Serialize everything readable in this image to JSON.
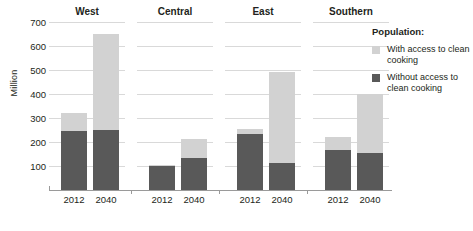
{
  "chart_data": {
    "type": "bar",
    "subtype": "stacked-bar-small-multiples",
    "title": "",
    "xlabel": "",
    "ylabel": "Million",
    "ylim": [
      0,
      700
    ],
    "yticks": [
      100,
      200,
      300,
      400,
      500,
      600,
      700
    ],
    "grid": true,
    "legend_position": "right",
    "legend_title": "Population:",
    "categories": [
      "2012",
      "2040"
    ],
    "panels": [
      "West",
      "Central",
      "East",
      "Southern"
    ],
    "series": [
      {
        "name": "Without access to clean cooking",
        "color": "#595959",
        "values_by_panel": {
          "West": [
            245,
            250
          ],
          "Central": [
            100,
            133
          ],
          "East": [
            232,
            112
          ],
          "Southern": [
            165,
            155
          ]
        }
      },
      {
        "name": "With access to clean cooking",
        "color": "#d2d2d2",
        "values_by_panel": {
          "West": [
            75,
            400
          ],
          "Central": [
            5,
            79
          ],
          "East": [
            21,
            378
          ],
          "Southern": [
            55,
            245
          ]
        }
      }
    ],
    "totals_by_panel": {
      "West": [
        320,
        650
      ],
      "Central": [
        105,
        212
      ],
      "East": [
        253,
        490
      ],
      "Southern": [
        220,
        400
      ]
    }
  },
  "axis": {
    "ylabel": "Million",
    "yticks": [
      "700",
      "600",
      "500",
      "400",
      "300",
      "200",
      "100"
    ]
  },
  "panels": [
    {
      "title": "West",
      "bars": [
        {
          "label": "2012"
        },
        {
          "label": "2040"
        }
      ]
    },
    {
      "title": "Central",
      "bars": [
        {
          "label": "2012"
        },
        {
          "label": "2040"
        }
      ]
    },
    {
      "title": "East",
      "bars": [
        {
          "label": "2012"
        },
        {
          "label": "2040"
        }
      ]
    },
    {
      "title": "Southern",
      "bars": [
        {
          "label": "2012"
        },
        {
          "label": "2040"
        }
      ]
    }
  ],
  "legend": {
    "title": "Population:",
    "items": [
      {
        "label": "With access to clean cooking",
        "color": "#d2d2d2"
      },
      {
        "label": "Without access to clean cooking",
        "color": "#595959"
      }
    ]
  }
}
